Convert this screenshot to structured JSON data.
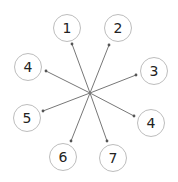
{
  "diagram": {
    "width": 178,
    "height": 182,
    "hub": {
      "x": 90,
      "y": 93
    },
    "colors": {
      "line": "#777777",
      "circle_border": "#bdbdbd",
      "label": "#222222",
      "background": "#ffffff"
    },
    "nodes": [
      {
        "label": "1",
        "x": 67,
        "y": 28,
        "arrow_tip": {
          "x": 72,
          "y": 44
        }
      },
      {
        "label": "2",
        "x": 118,
        "y": 28,
        "arrow_tip": {
          "x": 109,
          "y": 45
        }
      },
      {
        "label": "4",
        "x": 28,
        "y": 67,
        "arrow_tip": {
          "x": 46,
          "y": 71
        }
      },
      {
        "label": "3",
        "x": 154,
        "y": 71,
        "arrow_tip": {
          "x": 136,
          "y": 75
        }
      },
      {
        "label": "5",
        "x": 27,
        "y": 118,
        "arrow_tip": {
          "x": 43,
          "y": 111
        }
      },
      {
        "label": "4",
        "x": 151,
        "y": 123,
        "arrow_tip": {
          "x": 134,
          "y": 116
        }
      },
      {
        "label": "6",
        "x": 63,
        "y": 157,
        "arrow_tip": {
          "x": 71,
          "y": 141
        }
      },
      {
        "label": "7",
        "x": 113,
        "y": 158,
        "arrow_tip": {
          "x": 107,
          "y": 141
        }
      }
    ]
  }
}
